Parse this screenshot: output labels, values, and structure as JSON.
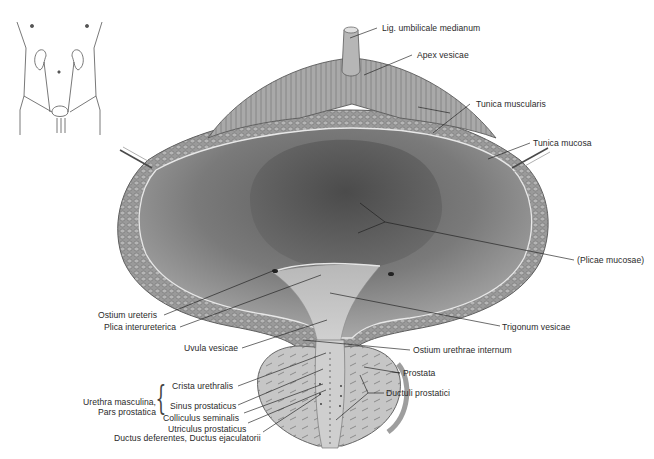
{
  "figure": {
    "orientation_inset": {
      "name": "body-orientation-sketch",
      "description": "torso outline with kidneys, ureters and bladder"
    }
  },
  "labels": {
    "lig_umbilicale_medianum": "Lig. umbilicale medianum",
    "apex_vesicae": "Apex vesicae",
    "tunica_muscularis": "Tunica muscularis",
    "tunica_mucosa": "Tunica mucosa",
    "plicae_mucosae": "(Plicae mucosae)",
    "ostium_ureteris": "Ostium ureteris",
    "plica_interureterica": "Plica interureterica",
    "trigonum_vesicae": "Trigonum vesicae",
    "uvula_vesicae": "Uvula vesicae",
    "ostium_urethrae_internum": "Ostium urethrae internum",
    "prostata": "Prostata",
    "ductuli_prostatici": "Ductuli prostatici",
    "crista_urethralis": "Crista urethralis",
    "urethra_masculina_line1": "Urethra masculina,",
    "urethra_masculina_line2": "Pars prostatica",
    "sinus_prostaticus": "Sinus prostaticus",
    "colliculus_seminalis": "Colliculus seminalis",
    "utriculus_prostaticus": "Utriculus prostaticus",
    "ductus_deferentes": "Ductus deferentes, Ductus ejaculatorii"
  },
  "brace_glyph": "{",
  "colors": {
    "background": "#ffffff",
    "label_text": "#2a2a2a",
    "leader_line": "#1e1e1e",
    "muscle_wall": "#9a9a9a",
    "mucosa_interior": "#6e6e6e",
    "outer_rim": "#8c8c8c"
  }
}
